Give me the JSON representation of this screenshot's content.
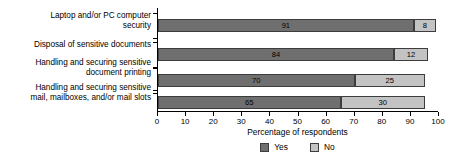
{
  "chart_data": {
    "type": "bar",
    "orientation": "horizontal",
    "stacked": true,
    "title": "",
    "xlabel": "Percentage of respondents",
    "ylabel": "",
    "xlim": [
      0,
      100
    ],
    "xticks": [
      0,
      10,
      20,
      30,
      40,
      50,
      60,
      70,
      80,
      90,
      100
    ],
    "xticklabels": [
      "0",
      "10",
      "20",
      "30",
      "40",
      "50",
      "60",
      "70",
      "80",
      "90",
      "100"
    ],
    "grid": false,
    "legend_position": "bottom-center",
    "categories": [
      "Laptop and/or PC computer\nsecurity",
      "Disposal of sensitive documents",
      "Handling and securing sensitive\ndocument printing",
      "Handling and securing sensitive\nmail, mailboxes, and/or mail slots"
    ],
    "series": [
      {
        "name": "Yes",
        "color": "#6f6f6f",
        "values": [
          91,
          84,
          70,
          65
        ]
      },
      {
        "name": "No",
        "color": "#c3c3c3",
        "values": [
          8,
          12,
          25,
          30
        ]
      }
    ]
  },
  "legend": {
    "items": [
      {
        "label": "Yes",
        "color": "#6f6f6f"
      },
      {
        "label": "No",
        "color": "#c3c3c3"
      }
    ]
  }
}
